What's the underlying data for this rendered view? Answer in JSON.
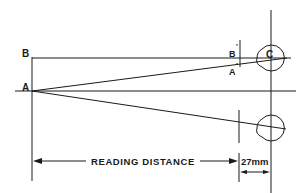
{
  "diagram": {
    "labels": {
      "point_a": "A",
      "point_b": "B",
      "point_c": "C",
      "point_a_prime": "A",
      "point_b_prime": "B",
      "prime_mark": "'",
      "reading_distance": "READING DISTANCE",
      "eye_offset": "27mm"
    },
    "colors": {
      "line": "#1a1a1a",
      "background": "#ffffff"
    }
  }
}
